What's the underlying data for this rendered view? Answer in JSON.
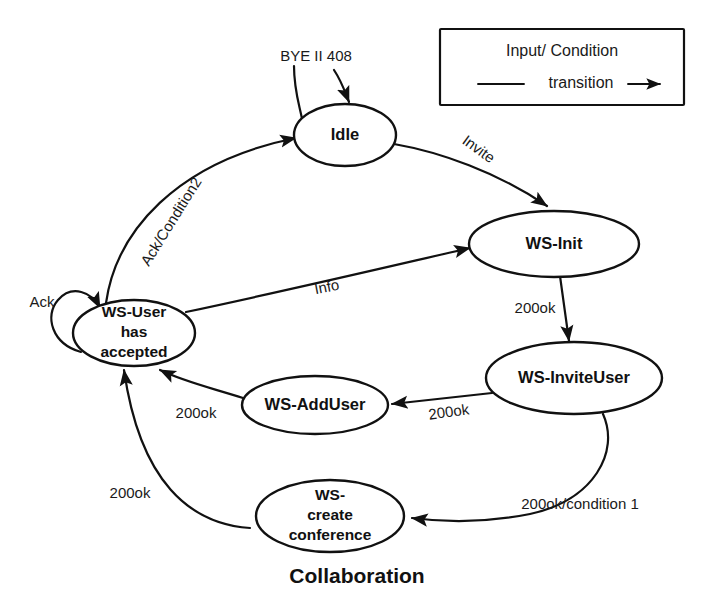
{
  "diagram": {
    "caption": "Collaboration",
    "legend": {
      "title": "Input/ Condition",
      "transition_label": "transition"
    },
    "states": [
      {
        "id": "idle",
        "label": "Idle"
      },
      {
        "id": "ws-init",
        "label": "WS-Init"
      },
      {
        "id": "ws-inviteuser",
        "label": "WS-InviteUser"
      },
      {
        "id": "ws-adduser",
        "label": "WS-AddUser"
      },
      {
        "id": "ws-user-accepted",
        "line1": "WS-User",
        "line2": "has",
        "line3": "accepted"
      },
      {
        "id": "ws-create-conference",
        "line1": "WS-",
        "line2": "create",
        "line3": "conference"
      }
    ],
    "transitions": [
      {
        "id": "bye-408",
        "label": "BYE II 408",
        "from": "external",
        "to": "idle"
      },
      {
        "id": "idle-init",
        "label": "Invite",
        "from": "idle",
        "to": "ws-init"
      },
      {
        "id": "init-inviteuser",
        "label": "200ok",
        "from": "ws-init",
        "to": "ws-inviteuser"
      },
      {
        "id": "inviteuser-adduser",
        "label": "200ok",
        "from": "ws-inviteuser",
        "to": "ws-adduser"
      },
      {
        "id": "adduser-user",
        "label": "200ok",
        "from": "ws-adduser",
        "to": "ws-user-accepted"
      },
      {
        "id": "inviteuser-conference",
        "label": "200ok/condition 1",
        "from": "ws-inviteuser",
        "to": "ws-create-conference"
      },
      {
        "id": "conference-user",
        "label": "200ok",
        "from": "ws-create-conference",
        "to": "ws-user-accepted"
      },
      {
        "id": "user-init",
        "label": "Info",
        "from": "ws-user-accepted",
        "to": "ws-init"
      },
      {
        "id": "user-idle",
        "label": "Ack/Condition2",
        "from": "ws-user-accepted",
        "to": "idle"
      },
      {
        "id": "user-self",
        "label": "Ack",
        "from": "ws-user-accepted",
        "to": "ws-user-accepted"
      }
    ]
  }
}
